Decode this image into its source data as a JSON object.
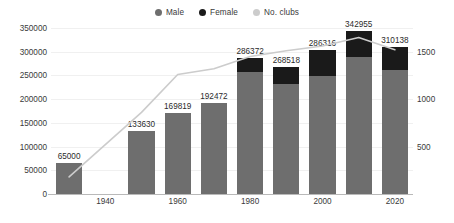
{
  "legend": {
    "items": [
      {
        "label": "Male",
        "color": "#6e6e6e",
        "icon": "circle-swatch-icon"
      },
      {
        "label": "Female",
        "color": "#1a1a1a",
        "icon": "circle-swatch-icon"
      },
      {
        "label": "No. clubs",
        "color": "#cccccc",
        "icon": "circle-swatch-icon"
      }
    ]
  },
  "chart_data": {
    "type": "bar",
    "title": "",
    "subtitle": "",
    "xlabel": "",
    "ylabel": "",
    "y2label": "",
    "grid": true,
    "legend_position": "top-center",
    "stacked": true,
    "categories": [
      "1930",
      "1940",
      "1950",
      "1960",
      "1970",
      "1980",
      "1990",
      "2000",
      "2010",
      "2020"
    ],
    "xtick_labels": [
      "1940",
      "1960",
      "1980",
      "2000",
      "2020"
    ],
    "xtick_categories": [
      "1940",
      "1960",
      "1980",
      "2000",
      "2020"
    ],
    "ylim": [
      0,
      350000
    ],
    "yticks": [
      0,
      50000,
      100000,
      150000,
      200000,
      250000,
      300000,
      350000
    ],
    "ytick_labels": [
      "0",
      "50000",
      "100000",
      "150000",
      "200000",
      "250000",
      "300000",
      "350000"
    ],
    "y2lim": [
      0,
      1750
    ],
    "y2ticks": [
      500,
      1000,
      1500
    ],
    "y2tick_labels": [
      "500",
      "1000",
      "1500"
    ],
    "series": [
      {
        "name": "Male",
        "axis": "left",
        "color": "#6e6e6e",
        "values": [
          65000,
          null,
          133630,
          169819,
          192472,
          257000,
          231000,
          249000,
          289000,
          261000
        ]
      },
      {
        "name": "Female",
        "axis": "left",
        "color": "#1a1a1a",
        "values": [
          0,
          null,
          0,
          0,
          0,
          29372,
          37518,
          55316,
          53955,
          49138
        ]
      },
      {
        "name": "No. clubs",
        "axis": "right",
        "color": "#cccccc",
        "type": "line",
        "values": [
          180,
          null,
          860,
          1260,
          1320,
          1450,
          1510,
          1560,
          1650,
          1520
        ]
      }
    ],
    "bar_total_labels": [
      "65000",
      null,
      "133630",
      "169819",
      "192472",
      "286372",
      "268518",
      "286316",
      "342955",
      "310138"
    ],
    "bar_totals": [
      65000,
      null,
      133630,
      169819,
      192472,
      286372,
      268518,
      286316,
      342955,
      310138
    ]
  }
}
